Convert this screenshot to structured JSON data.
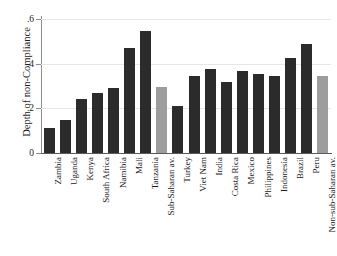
{
  "chart_data": {
    "type": "bar",
    "title": "",
    "subtitle": "",
    "xlabel": "",
    "ylabel": "Depth of non-Compliance",
    "ylim": [
      0,
      0.6
    ],
    "ytick_labels": [
      "0",
      ".2",
      ".4",
      ".6"
    ],
    "ytick_values": [
      0,
      0.2,
      0.4,
      0.6
    ],
    "grid": true,
    "legend": "none",
    "categories": [
      "Zambia",
      "Uganda",
      "Kenya",
      "South Africa",
      "Namibia",
      "Mali",
      "Tanzania",
      "Sub-Saharan av.",
      "Turkey",
      "Viet Nam",
      "India",
      "Costa Rica",
      "Mexico",
      "Philippines",
      "Indonesia",
      "Brazil",
      "Peru",
      "Non-sub-Saharan av."
    ],
    "values": [
      0.11,
      0.15,
      0.24,
      0.27,
      0.29,
      0.47,
      0.545,
      0.297,
      0.212,
      0.345,
      0.375,
      0.32,
      0.365,
      0.355,
      0.345,
      0.425,
      0.49,
      0.345
    ],
    "bar_colors": [
      "#2b2b2b",
      "#2b2b2b",
      "#2b2b2b",
      "#2b2b2b",
      "#2b2b2b",
      "#2b2b2b",
      "#2b2b2b",
      "#9d9d9d",
      "#2b2b2b",
      "#2b2b2b",
      "#2b2b2b",
      "#2b2b2b",
      "#2b2b2b",
      "#2b2b2b",
      "#2b2b2b",
      "#2b2b2b",
      "#2b2b2b",
      "#9d9d9d"
    ],
    "colors": {
      "country_bar": "#2b2b2b",
      "average_bar": "#9d9d9d",
      "gridline": "#e6e6e6",
      "axis": "#5a5a5a",
      "text": "#1a1a1a",
      "background": "#ffffff"
    }
  }
}
